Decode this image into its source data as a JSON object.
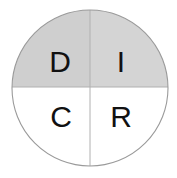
{
  "figure": {
    "name": "quadrant-circle-diagram",
    "shape": "circle",
    "divisions": "two perpendicular diameters forming four quadrants",
    "background_color": "#ffffff",
    "outline_color": "#9a9a9a"
  },
  "circle": {
    "center_x": 90,
    "center_y": 88,
    "radius": 78,
    "stroke_width": 1
  },
  "dividers": {
    "vertical_x": 90,
    "horizontal_y": 87,
    "color": "#b0b0b0",
    "stroke_width": 1
  },
  "quadrants": [
    {
      "id": "top-left",
      "label": "D",
      "fill": "#cfcfcf",
      "label_x": 60,
      "label_y": 60
    },
    {
      "id": "top-right",
      "label": "I",
      "fill": "#d4d4d4",
      "label_x": 121,
      "label_y": 60
    },
    {
      "id": "bottom-left",
      "label": "C",
      "fill": "#ffffff",
      "label_x": 61,
      "label_y": 115
    },
    {
      "id": "bottom-right",
      "label": "R",
      "fill": "#ffffff",
      "label_x": 121,
      "label_y": 115
    }
  ],
  "labels": {
    "top_left": "D",
    "top_right": "I",
    "bottom_left": "C",
    "bottom_right": "R"
  }
}
